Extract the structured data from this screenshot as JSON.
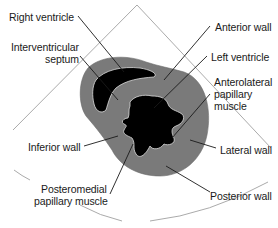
{
  "diagram": {
    "type": "anatomical cross-section (echocardiographic short-axis view of the heart)",
    "colors": {
      "myocardium": "#7a7a7a",
      "cavity": "#000000",
      "leader_line": "#1a1a1a",
      "sector_outline": "#9a9a9a",
      "text": "#1a1a1a"
    },
    "labels": {
      "right_ventricle": "Right ventricle",
      "interventricular_septum_1": "Interventricular",
      "interventricular_septum_2": "septum",
      "anterior_wall": "Anterior wall",
      "left_ventricle": "Left ventricle",
      "anterolateral_pm_1": "Anterolateral",
      "anterolateral_pm_2": "papillary",
      "anterolateral_pm_3": "muscle",
      "inferior_wall": "Inferior wall",
      "lateral_wall": "Lateral wall",
      "posteromedial_pm_1": "Posteromedial",
      "posteromedial_pm_2": "papillary muscle",
      "posterior_wall": "Posterior wall"
    }
  }
}
